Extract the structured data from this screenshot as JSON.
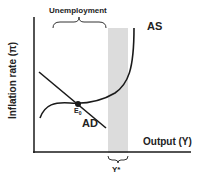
{
  "diagram": {
    "y_axis_label": "Inflation rate (π)",
    "x_axis_label": "Output (Y)",
    "curves": {
      "as": "AS",
      "ad": "AD"
    },
    "equilibrium_label": "E",
    "equilibrium_subscript": "0",
    "potential_output_label": "Y*",
    "bracket_label": "Unemployment",
    "colors": {
      "line": "#1a1a1a",
      "shade": "#dcdcdc"
    }
  }
}
